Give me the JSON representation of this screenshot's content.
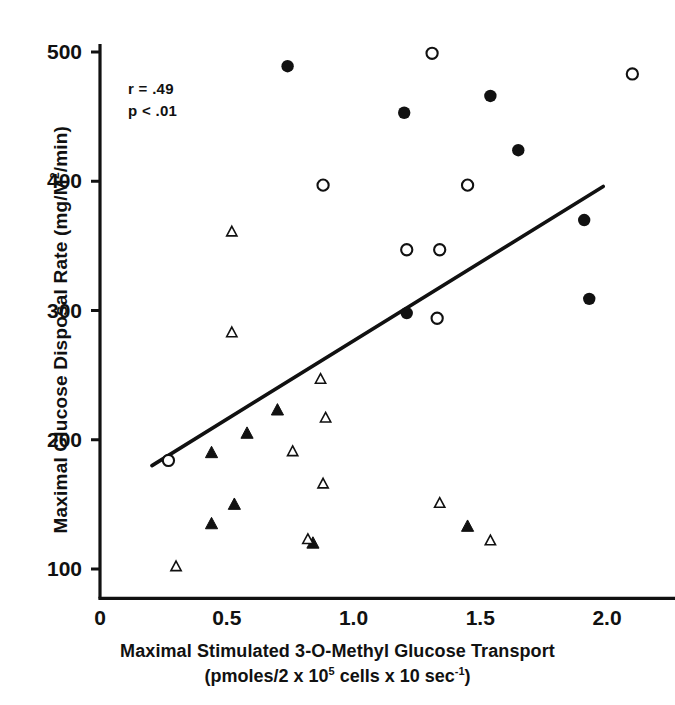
{
  "chart_data": {
    "type": "scatter",
    "title": "",
    "xlabel": "Maximal Stimulated 3-O-Methyl Glucose Transport",
    "xlabel_units": "(pmoles/2 x 10^5 cells x 10 sec-1)",
    "ylabel": "Maximal Glucose Disposal Rate (mg/M^2/min)",
    "xlim": [
      0,
      2.2
    ],
    "ylim": [
      85,
      510
    ],
    "xticks": [
      0,
      0.5,
      1.0,
      1.5,
      2.0
    ],
    "xtick_labels": [
      "0",
      "0.5",
      "1.0",
      "1.5",
      "2.0"
    ],
    "yticks": [
      100,
      200,
      300,
      400,
      500
    ],
    "ytick_labels": [
      "100",
      "200",
      "300",
      "400",
      "500"
    ],
    "grid": false,
    "legend": "none",
    "annotations": [
      "r = .49",
      "p < .01"
    ],
    "statistics": {
      "r": ".49",
      "p": "< .01"
    },
    "marker_colors": {
      "filled": "#111111",
      "open_stroke": "#111111",
      "open_fill": "#ffffff",
      "line": "#111111"
    },
    "series": [
      {
        "name": "filled-circle",
        "marker": "filled-circle",
        "points": [
          {
            "x": 0.74,
            "y": 489
          },
          {
            "x": 1.2,
            "y": 453
          },
          {
            "x": 1.54,
            "y": 466
          },
          {
            "x": 1.65,
            "y": 424
          },
          {
            "x": 1.91,
            "y": 370
          },
          {
            "x": 1.93,
            "y": 309
          },
          {
            "x": 1.21,
            "y": 298
          }
        ]
      },
      {
        "name": "open-circle",
        "marker": "open-circle",
        "points": [
          {
            "x": 1.31,
            "y": 499
          },
          {
            "x": 2.1,
            "y": 483
          },
          {
            "x": 0.88,
            "y": 397
          },
          {
            "x": 1.45,
            "y": 397
          },
          {
            "x": 1.21,
            "y": 347
          },
          {
            "x": 1.34,
            "y": 347
          },
          {
            "x": 1.33,
            "y": 294
          },
          {
            "x": 0.27,
            "y": 184
          }
        ]
      },
      {
        "name": "filled-triangle",
        "marker": "filled-triangle",
        "points": [
          {
            "x": 0.7,
            "y": 223
          },
          {
            "x": 0.58,
            "y": 205
          },
          {
            "x": 0.44,
            "y": 190
          },
          {
            "x": 0.53,
            "y": 150
          },
          {
            "x": 0.44,
            "y": 135
          },
          {
            "x": 1.45,
            "y": 133
          },
          {
            "x": 0.84,
            "y": 120
          }
        ]
      },
      {
        "name": "open-triangle",
        "marker": "open-triangle",
        "points": [
          {
            "x": 0.52,
            "y": 361
          },
          {
            "x": 0.52,
            "y": 283
          },
          {
            "x": 0.87,
            "y": 247
          },
          {
            "x": 0.89,
            "y": 217
          },
          {
            "x": 0.76,
            "y": 191
          },
          {
            "x": 0.88,
            "y": 166
          },
          {
            "x": 1.34,
            "y": 151
          },
          {
            "x": 0.82,
            "y": 123
          },
          {
            "x": 1.54,
            "y": 122
          },
          {
            "x": 0.3,
            "y": 102
          }
        ]
      }
    ],
    "fit_line": {
      "name": "regression-line",
      "x1": 0.205,
      "y1": 180,
      "x2": 1.985,
      "y2": 396
    }
  }
}
